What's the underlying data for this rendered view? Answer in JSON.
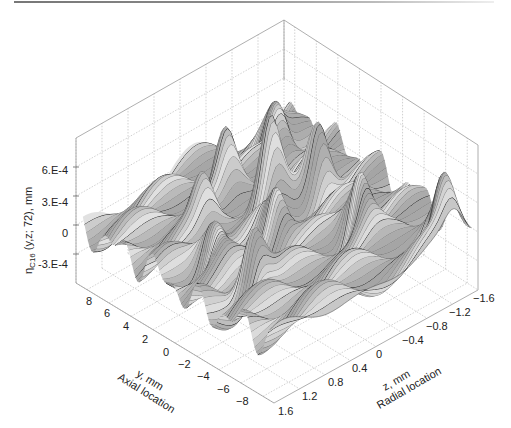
{
  "chart_data": {
    "type": "surface3d",
    "title": "",
    "zlabel": {
      "main": "η",
      "sub": "C16",
      "rest": " (y,z; 72), mm"
    },
    "ylabel_line1": "y, mm",
    "ylabel_line2": "Axial location",
    "xlabel_line1": "z, mm",
    "xlabel_line2": "Radial location",
    "z_ticks": [
      "6.E-4",
      "3.E-4",
      "0",
      "-3.E-4"
    ],
    "z_tick_values": [
      0.0006,
      0.0003,
      0,
      -0.0003
    ],
    "zlim": [
      -0.0006,
      0.0009
    ],
    "y_ticks": [
      "8",
      "6",
      "4",
      "2",
      "0",
      "−2",
      "−4",
      "−6",
      "−8"
    ],
    "y_tick_values": [
      8,
      6,
      4,
      2,
      0,
      -2,
      -4,
      -6,
      -8
    ],
    "ylim": [
      -9,
      9
    ],
    "x_ticks": [
      "1.6",
      "1.2",
      "0.8",
      "0.4",
      "0",
      "−0.4",
      "−0.8",
      "−1.2",
      "−1.6"
    ],
    "x_tick_values": [
      1.6,
      1.2,
      0.8,
      0.4,
      0,
      -0.4,
      -0.8,
      -1.2,
      -1.6
    ],
    "xlim": [
      -1.6,
      1.6
    ],
    "grid": true,
    "style": "grayscale wireframe mesh",
    "surface_description": "irregular oscillating surface with many peaks up to ~9E-4 and troughs to ~-5E-4",
    "surface_peaks": [
      {
        "y": 2.0,
        "z": -0.2,
        "h": 0.0008
      },
      {
        "y": -1.0,
        "z": 0.2,
        "h": 0.00075
      },
      {
        "y": 1.0,
        "z": -0.8,
        "h": 0.0007
      },
      {
        "y": -4.0,
        "z": -0.6,
        "h": 0.0008
      },
      {
        "y": -7.5,
        "z": -1.3,
        "h": 0.0006
      },
      {
        "y": 5.0,
        "z": 0.0,
        "h": 0.0006
      },
      {
        "y": 6.0,
        "z": -1.0,
        "h": 0.0005
      },
      {
        "y": -3.0,
        "z": 0.9,
        "h": 0.0006
      },
      {
        "y": 0.5,
        "z": 0.9,
        "h": 0.0005
      },
      {
        "y": 3.5,
        "z": 0.6,
        "h": 0.0004
      }
    ]
  }
}
